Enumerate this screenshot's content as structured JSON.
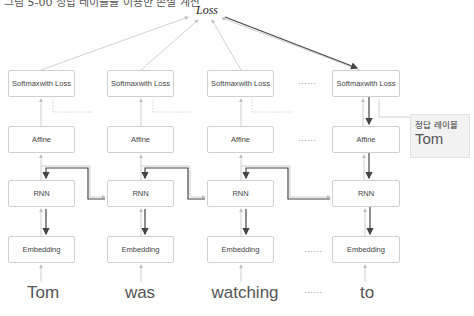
{
  "caption_partial": "그림 5-00 정답 레이블을 이용한 손실 계산",
  "loss_label": "Loss",
  "layers": {
    "softmax": "Softmax with Loss",
    "softmax_line1": "Softmax",
    "softmax_line2": "with Loss",
    "affine": "Affine",
    "rnn": "RNN",
    "embedding": "Embedding"
  },
  "inputs": [
    "Tom",
    "was",
    "watching",
    "to"
  ],
  "ellipsis": "……",
  "callout": {
    "title": "정답 레이블",
    "value": "Tom"
  },
  "colors": {
    "box_border": "#cfcfcf",
    "thin_arrow": "#bdbdbd",
    "bold_arrow": "#444444",
    "callout_bg": "#f2f2f2"
  }
}
